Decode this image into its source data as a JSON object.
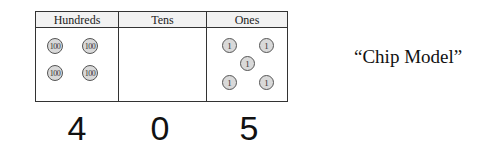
{
  "table": {
    "columns": [
      {
        "header": "Hundreds",
        "chip_label": "100",
        "chip_count": 4
      },
      {
        "header": "Tens",
        "chip_label": "10",
        "chip_count": 0
      },
      {
        "header": "Ones",
        "chip_label": "1",
        "chip_count": 5
      }
    ]
  },
  "chips": {
    "hundreds": [
      "100",
      "100",
      "100",
      "100"
    ],
    "ones": [
      "1",
      "1",
      "1",
      "1",
      "1"
    ]
  },
  "digits": [
    "4",
    "0",
    "5"
  ],
  "caption": "“Chip Model”",
  "colors": {
    "chip_fill": "#d9d9d9",
    "chip_border": "#555555",
    "header_fill": "#f2f2f2",
    "border": "#333333"
  }
}
